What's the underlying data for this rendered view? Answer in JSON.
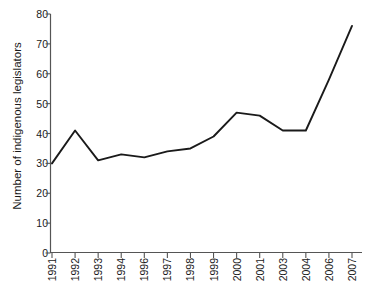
{
  "chart_data": {
    "type": "line",
    "title": "",
    "xlabel": "",
    "ylabel": "Number of indigenous legislators",
    "categories": [
      "1991",
      "1992",
      "1993",
      "1994",
      "1996",
      "1997",
      "1998",
      "1999",
      "2000",
      "2001",
      "2003",
      "2004",
      "2006",
      "2007"
    ],
    "values": [
      30,
      41,
      31,
      33,
      32,
      34,
      35,
      39,
      47,
      46,
      41,
      41,
      58,
      76
    ],
    "series": [
      {
        "name": "Number of indigenous legislators",
        "values": [
          30,
          41,
          31,
          33,
          32,
          34,
          35,
          39,
          47,
          46,
          41,
          41,
          58,
          76
        ]
      }
    ],
    "ylim": [
      0,
      80
    ],
    "ytick_labels": [
      "0",
      "10",
      "20",
      "30",
      "40",
      "50",
      "60",
      "70",
      "80"
    ],
    "ytick_values": [
      0,
      10,
      20,
      30,
      40,
      50,
      60,
      70,
      80
    ],
    "grid": false,
    "legend": false,
    "legend_position": "none",
    "markers": false,
    "line_color": "#1a1a1a",
    "axis_color": "#4d4d4d",
    "background_color": "#ffffff"
  }
}
